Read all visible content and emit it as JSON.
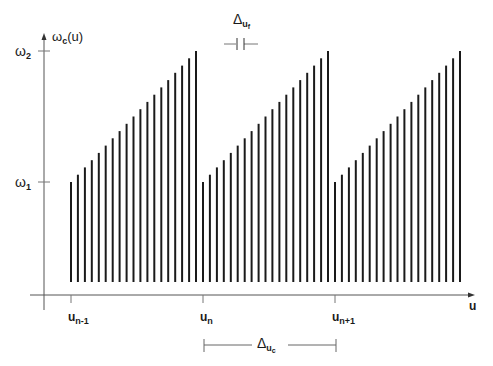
{
  "diagram": {
    "type": "sawtooth_frequency_comb",
    "y_axis": {
      "label_main": "ω",
      "label_sub": "c",
      "label_arg": "(u)"
    },
    "x_axis": {
      "label": "u"
    },
    "y_ticks": [
      {
        "main": "ω",
        "sub": "2",
        "level": "top"
      },
      {
        "main": "ω",
        "sub": "1",
        "level": "bottom"
      }
    ],
    "x_ticks": [
      {
        "main": "u",
        "sub": "n-1"
      },
      {
        "main": "u",
        "sub": "n"
      },
      {
        "main": "u",
        "sub": "n+1"
      }
    ],
    "fine_spacing": {
      "main": "Δ",
      "sub": "u",
      "subsub": "f"
    },
    "coarse_spacing": {
      "main": "Δ",
      "sub": "u",
      "subsub": "c"
    },
    "groups": 3,
    "bars_per_group": 19,
    "colors": {
      "line": "#1a1a1a",
      "axis": "#555555",
      "background": "#ffffff"
    }
  }
}
